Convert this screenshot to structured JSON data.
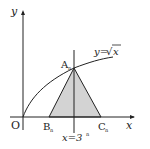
{
  "diagram": {
    "axes": {
      "x_label": "x",
      "y_label": "y",
      "origin_label": "O"
    },
    "curve_label_lhs": "y=",
    "curve_label_sqrt": "x",
    "points": {
      "A": "A",
      "A_sub": "n",
      "B": "B",
      "B_sub": "n",
      "C": "C",
      "C_sub": "n"
    },
    "line_label": "x=3",
    "line_label_sup": "n",
    "colors": {
      "fill": "#d3d3d3",
      "stroke": "#222222"
    }
  }
}
